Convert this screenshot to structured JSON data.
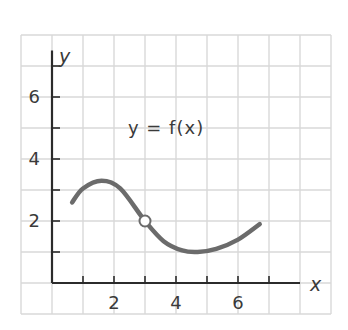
{
  "chart_data": {
    "type": "line",
    "title": "",
    "annotation": "y = f(x)",
    "xlabel": "x",
    "ylabel": "y",
    "xlim": [
      -1,
      8
    ],
    "ylim": [
      -1,
      8
    ],
    "x_ticks": [
      1,
      2,
      3,
      4,
      5,
      6,
      7
    ],
    "x_tick_labels": [
      "2",
      "4",
      "6"
    ],
    "x_tick_label_values": [
      2,
      4,
      6
    ],
    "y_ticks": [
      1,
      2,
      3,
      4,
      5,
      6,
      7
    ],
    "y_tick_labels": [
      "2",
      "4",
      "6"
    ],
    "y_tick_label_values": [
      2,
      4,
      6
    ],
    "grid": true,
    "series": [
      {
        "name": "f(x)",
        "x": [
          0.65,
          1.0,
          1.6,
          2.2,
          3.0,
          3.6,
          4.2,
          4.7,
          5.3,
          6.0,
          6.7
        ],
        "y": [
          2.6,
          3.05,
          3.3,
          3.05,
          2.0,
          1.35,
          1.05,
          1.0,
          1.1,
          1.4,
          1.9
        ]
      }
    ],
    "open_points": [
      {
        "x": 3,
        "y": 2
      }
    ],
    "colors": {
      "curve": "#6b6b6b",
      "grid": "#d6d6d6",
      "axis": "#2b2b2b",
      "text": "#3a3a3a"
    }
  }
}
